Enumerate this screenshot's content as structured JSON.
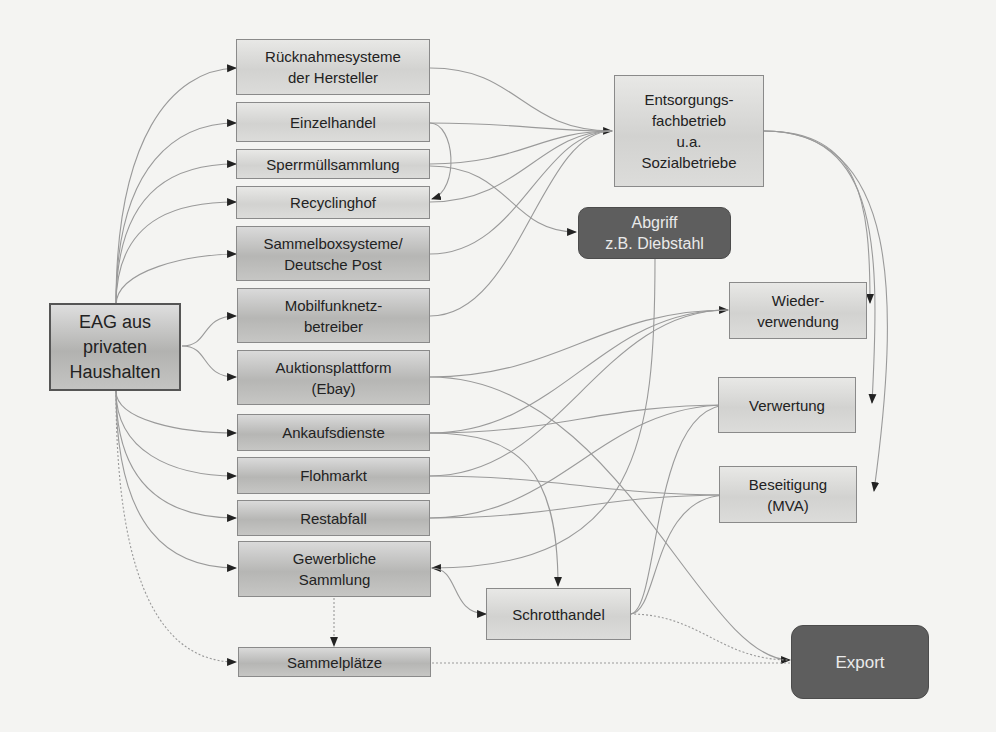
{
  "diagram": {
    "source": {
      "label": "EAG aus\nprivaten\nHaushalten"
    },
    "channels": [
      {
        "id": "ruecknahme",
        "label": "Rücknahmesysteme\nder Hersteller"
      },
      {
        "id": "einzelhandel",
        "label": "Einzelhandel"
      },
      {
        "id": "sperrmuell",
        "label": "Sperrmüllsammlung"
      },
      {
        "id": "recyclinghof",
        "label": "Recyclinghof"
      },
      {
        "id": "sammelbox",
        "label": "Sammelboxsysteme/\nDeutsche Post"
      },
      {
        "id": "mobilfunk",
        "label": "Mobilfunknetz-\nbetreiber"
      },
      {
        "id": "auktion",
        "label": "Auktionsplattform\n(Ebay)"
      },
      {
        "id": "ankauf",
        "label": "Ankaufsdienste"
      },
      {
        "id": "flohmarkt",
        "label": "Flohmarkt"
      },
      {
        "id": "restabfall",
        "label": "Restabfall"
      },
      {
        "id": "gewerblich",
        "label": "Gewerbliche\nSammlung"
      },
      {
        "id": "sammelplaetze",
        "label": "Sammelplätze"
      }
    ],
    "intermediates": {
      "entsorgung": {
        "label": "Entsorgungs-\nfachbetrieb\nu.a.\nSozialbetriebe"
      },
      "abgriff": {
        "label": "Abgriff\nz.B. Diebstahl"
      },
      "schrotthandel": {
        "label": "Schrotthandel"
      }
    },
    "destinations": {
      "wiederverwendung": {
        "label": "Wieder-\nverwendung"
      },
      "verwertung": {
        "label": "Verwertung"
      },
      "beseitigung": {
        "label": "Beseitigung\n(MVA)"
      },
      "export": {
        "label": "Export"
      }
    },
    "colors": {
      "background": "#f4f4f2",
      "edge": "#9a9a9a",
      "dark_node": "#5e5e5e",
      "arrow": "#222222"
    }
  }
}
